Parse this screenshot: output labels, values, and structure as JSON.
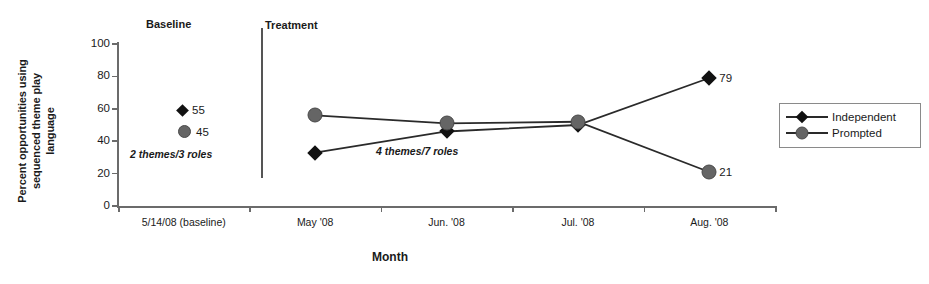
{
  "chart_data": {
    "type": "line",
    "title": "",
    "xlabel": "Month",
    "ylabel": "Percent opportunities using sequenced theme play language",
    "categories": [
      "5/14/08 (baseline)",
      "May '08",
      "Jun. '08",
      "Jul. '08",
      "Aug. '08"
    ],
    "ylim": [
      0,
      100
    ],
    "yticks": [
      0,
      20,
      40,
      60,
      80,
      100
    ],
    "grid": false,
    "legend_position": "right",
    "series": [
      {
        "name": "Independent",
        "marker": "diamond",
        "color": "#111111",
        "values": [
          55,
          33,
          46,
          50,
          79
        ]
      },
      {
        "name": "Prompted",
        "marker": "circle",
        "color": "#656565",
        "values": [
          45,
          56,
          51,
          52,
          21
        ]
      }
    ],
    "point_labels": [
      {
        "series": "Independent",
        "category": "5/14/08 (baseline)",
        "text": "55"
      },
      {
        "series": "Prompted",
        "category": "5/14/08 (baseline)",
        "text": "45"
      },
      {
        "series": "Independent",
        "category": "Aug. '08",
        "text": "79"
      },
      {
        "series": "Prompted",
        "category": "Aug. '08",
        "text": "21"
      }
    ],
    "phases": [
      {
        "label": "Baseline",
        "annotation": "2 themes/3 roles"
      },
      {
        "label": "Treatment",
        "annotation": "4 themes/7 roles"
      }
    ],
    "annotations": [
      "2 themes/3 roles",
      "4 themes/7 roles"
    ]
  },
  "axis": {
    "y_title": "Percent opportunities using sequenced theme play language",
    "y_title_lines": [
      "Percent opportunities using",
      "sequenced theme play",
      "language"
    ],
    "x_title": "Month",
    "y_ticks": [
      "100",
      "80",
      "60",
      "40",
      "20",
      "0"
    ],
    "x_ticks": [
      "5/14/08 (baseline)",
      "May '08",
      "Jun. '08",
      "Jul. '08",
      "Aug. '08"
    ]
  },
  "phases": {
    "baseline_label": "Baseline",
    "treatment_label": "Treatment",
    "baseline_annotation": "2 themes/3 roles",
    "treatment_annotation": "4 themes/7 roles"
  },
  "baseline_markers": [
    {
      "marker": "diamond-marker",
      "value": "55"
    },
    {
      "marker": "circle-marker",
      "value": "45"
    }
  ],
  "end_labels": {
    "independent": "79",
    "prompted": "21"
  },
  "legend": {
    "items": [
      {
        "label": "Independent",
        "marker": "diamond-marker"
      },
      {
        "label": "Prompted",
        "marker": "circle-marker"
      }
    ]
  },
  "colors": {
    "independent": "#111111",
    "prompted": "#656565",
    "axis": "#6b6b6b",
    "line": "#2a2a2a"
  }
}
